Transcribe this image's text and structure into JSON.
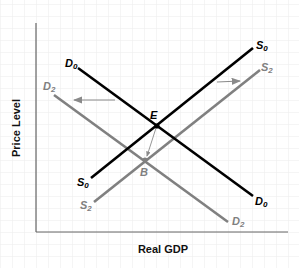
{
  "diagram": {
    "type": "AD-AS shift diagram",
    "x_axis_label": "Real GDP",
    "y_axis_label": "Price Level",
    "colors": {
      "original_curves": "#000000",
      "shifted_curves": "#808080",
      "arrows": "#8a8a8a",
      "grid": "#ececec",
      "axis": "#666666"
    },
    "curves": [
      {
        "id": "D0",
        "base": "D",
        "sub": "0",
        "role": "original demand"
      },
      {
        "id": "D2",
        "base": "D",
        "sub": "2",
        "role": "shifted demand"
      },
      {
        "id": "S0",
        "base": "S",
        "sub": "0",
        "role": "original supply"
      },
      {
        "id": "S2",
        "base": "S",
        "sub": "2",
        "role": "shifted supply"
      }
    ],
    "points": [
      {
        "id": "E",
        "label": "E",
        "description": "original equilibrium"
      },
      {
        "id": "B",
        "label": "B",
        "description": "new equilibrium"
      }
    ],
    "arrows": [
      {
        "id": "demand-shift",
        "direction": "left"
      },
      {
        "id": "supply-shift",
        "direction": "right"
      },
      {
        "id": "equilibrium-move",
        "direction": "from E to B"
      }
    ]
  }
}
